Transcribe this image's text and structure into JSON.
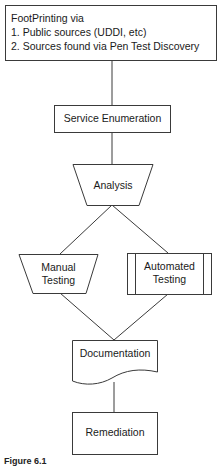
{
  "diagram": {
    "type": "flowchart",
    "nodes": {
      "footprinting": {
        "shape": "rectangle",
        "lines": [
          "FootPrinting via",
          "1. Public sources (UDDI, etc)",
          "2. Sources found via Pen Test Discovery"
        ]
      },
      "service_enumeration": {
        "shape": "rectangle",
        "label": "Service Enumeration"
      },
      "analysis": {
        "shape": "trapezoid-manual-operation",
        "label": "Analysis"
      },
      "manual_testing": {
        "shape": "trapezoid-manual-operation",
        "lines": [
          "Manual",
          "Testing"
        ]
      },
      "automated_testing": {
        "shape": "predefined-process",
        "lines": [
          "Automated",
          "Testing"
        ]
      },
      "documentation": {
        "shape": "document",
        "label": "Documentation"
      },
      "remediation": {
        "shape": "rectangle",
        "label": "Remediation"
      }
    },
    "edges": [
      [
        "footprinting",
        "service_enumeration"
      ],
      [
        "service_enumeration",
        "analysis"
      ],
      [
        "analysis",
        "manual_testing"
      ],
      [
        "analysis",
        "automated_testing"
      ],
      [
        "manual_testing",
        "documentation"
      ],
      [
        "automated_testing",
        "documentation"
      ],
      [
        "documentation",
        "remediation"
      ]
    ],
    "caption": "Figure 6.1",
    "stroke_color": "#3a3a3a"
  }
}
